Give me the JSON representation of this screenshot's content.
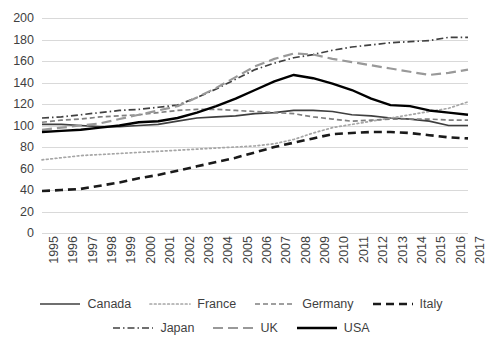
{
  "chart_data": {
    "type": "line",
    "title": "",
    "xlabel": "",
    "ylabel": "",
    "ylim": [
      0,
      200
    ],
    "y_ticks": [
      0,
      20,
      40,
      60,
      80,
      100,
      120,
      140,
      160,
      180,
      200
    ],
    "grid": true,
    "legend_position": "bottom",
    "categories": [
      "1995",
      "1996",
      "1997",
      "1998",
      "1999",
      "2000",
      "2001",
      "2002",
      "2003",
      "2004",
      "2005",
      "2006",
      "2007",
      "2008",
      "2009",
      "2010",
      "2011",
      "2012",
      "2013",
      "2014",
      "2015",
      "2016",
      "2017"
    ],
    "series": [
      {
        "name": "Canada",
        "color": "#3f3f3f",
        "style": "solid",
        "width": 1.7,
        "values": [
          101,
          101,
          100,
          99,
          99,
          100,
          101,
          104,
          107,
          108,
          109,
          111,
          112,
          114,
          114,
          113,
          110,
          109,
          107,
          106,
          104,
          100,
          100
        ]
      },
      {
        "name": "France",
        "color": "#a6a6a6",
        "style": "dotted",
        "width": 1.7,
        "values": [
          68,
          70,
          72,
          73,
          74,
          75,
          76,
          77,
          78,
          79,
          80,
          81,
          83,
          87,
          93,
          98,
          101,
          104,
          107,
          110,
          113,
          116,
          122
        ]
      },
      {
        "name": "Germany",
        "color": "#808080",
        "style": "dashed",
        "width": 1.7,
        "values": [
          103,
          105,
          106,
          108,
          109,
          110,
          112,
          114,
          115,
          115,
          114,
          113,
          112,
          111,
          108,
          106,
          104,
          105,
          106,
          106,
          106,
          105,
          105
        ]
      },
      {
        "name": "Italy",
        "color": "#1a1a1a",
        "style": "bold-dashed",
        "width": 2.6,
        "values": [
          39,
          40,
          41,
          44,
          47,
          51,
          54,
          58,
          62,
          66,
          70,
          75,
          80,
          84,
          88,
          92,
          93,
          94,
          94,
          93,
          91,
          89,
          88
        ]
      },
      {
        "name": "Japan",
        "color": "#404040",
        "style": "dashdot",
        "width": 1.7,
        "values": [
          107,
          108,
          110,
          112,
          114,
          115,
          117,
          119,
          126,
          134,
          143,
          152,
          158,
          163,
          166,
          170,
          173,
          175,
          177,
          178,
          179,
          182,
          182
        ]
      },
      {
        "name": "UK",
        "color": "#999999",
        "style": "longdash",
        "width": 2.2,
        "values": [
          96,
          98,
          100,
          102,
          106,
          110,
          114,
          118,
          126,
          135,
          145,
          155,
          162,
          167,
          166,
          162,
          159,
          156,
          153,
          150,
          147,
          149,
          152
        ]
      },
      {
        "name": "USA",
        "color": "#000000",
        "style": "solid",
        "width": 2.4,
        "values": [
          94,
          95,
          96,
          98,
          100,
          103,
          104,
          107,
          112,
          118,
          125,
          133,
          141,
          147,
          144,
          139,
          133,
          125,
          119,
          118,
          114,
          112,
          110
        ]
      }
    ]
  },
  "legend": {
    "rows": [
      [
        {
          "label": "Canada",
          "series": 0
        },
        {
          "label": "France",
          "series": 1
        },
        {
          "label": "Germany",
          "series": 2
        },
        {
          "label": "Italy",
          "series": 3
        }
      ],
      [
        {
          "label": "Japan",
          "series": 4
        },
        {
          "label": "UK",
          "series": 5
        },
        {
          "label": "USA",
          "series": 6
        }
      ]
    ]
  }
}
